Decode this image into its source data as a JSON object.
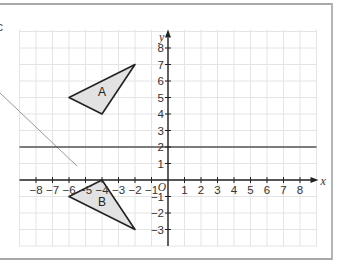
{
  "axes": {
    "x_label": "x",
    "y_label": "y",
    "origin_label": "O",
    "x_ticks": [
      "−8",
      "−7",
      "−6",
      "−5",
      "−4",
      "−3",
      "−2",
      "−1",
      "1",
      "2",
      "3",
      "4",
      "5",
      "6",
      "7",
      "8"
    ],
    "x_tick_values": [
      -8,
      -7,
      -6,
      -5,
      -4,
      -3,
      -2,
      -1,
      1,
      2,
      3,
      4,
      5,
      6,
      7,
      8
    ],
    "y_ticks": [
      "8",
      "7",
      "6",
      "5",
      "4",
      "3",
      "2",
      "1",
      "−1",
      "−2",
      "−3"
    ],
    "y_tick_values": [
      8,
      7,
      6,
      5,
      4,
      3,
      2,
      1,
      -1,
      -2,
      -3
    ],
    "xlim": [
      -9,
      9
    ],
    "ylim": [
      -4,
      9
    ]
  },
  "shapes": {
    "triangle_a": {
      "label": "A",
      "vertices": [
        [
          -6,
          5
        ],
        [
          -4,
          4
        ],
        [
          -2,
          7
        ]
      ]
    },
    "triangle_b": {
      "label": "B",
      "vertices": [
        [
          -6,
          -1
        ],
        [
          -4,
          0
        ],
        [
          -2,
          -3
        ]
      ]
    }
  },
  "lines": {
    "mirror_line": {
      "equation": "y = 2"
    }
  },
  "annotations": {
    "cut_char": "c"
  },
  "colors": {
    "grid": "#e4e4e4",
    "axis": "#222222",
    "shape_fill": "#e2e2e2",
    "shape_stroke": "#222222",
    "mirror_line": "#555555",
    "pointer_line": "#999999"
  }
}
